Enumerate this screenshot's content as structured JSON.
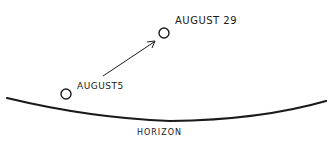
{
  "diagram": {
    "points": [
      {
        "label": "AUGUST5",
        "cx": 66,
        "cy": 94
      },
      {
        "label": "AUGUST 29",
        "cx": 164,
        "cy": 33
      }
    ],
    "arrow": {
      "from": "AUGUST5",
      "to": "AUGUST 29"
    },
    "horizon_label": "HORIZON",
    "colors": {
      "ink": "#1a1a1a",
      "background": "#ffffff"
    }
  }
}
